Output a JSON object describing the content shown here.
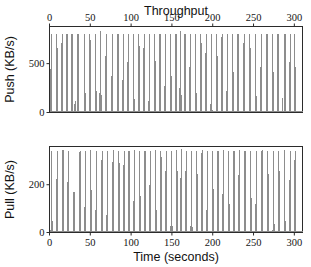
{
  "chart_data": {
    "type": "line",
    "title": "Throughput",
    "xlabel": "Time (seconds)",
    "xlim": [
      0,
      310
    ],
    "xticks": [
      0,
      50,
      100,
      150,
      200,
      250,
      300
    ],
    "xticklabels": [
      "0",
      "50",
      "100",
      "150",
      "200",
      "250",
      "300"
    ],
    "grid": false,
    "legend": null,
    "shared_x_axis": true,
    "line_color": "#8d8d8d",
    "frame_color": "#2b2b2b",
    "background": "#ffffff",
    "panels": [
      {
        "id": "push",
        "ylabel": "Push (KB/s)",
        "ylim": [
          0,
          880
        ],
        "yticks": [
          0,
          500
        ],
        "yticklabels": [
          "0",
          "500"
        ],
        "xtick_labels_position": "top",
        "description": "Dense train of narrow throughput bursts from a ~0 baseline up to roughly 800 KB/s.",
        "baseline": 8,
        "spike_peak_typical": 800,
        "spikes": [
          {
            "t": 2.2,
            "peak": 805,
            "width": 1.1
          },
          {
            "t": 9.0,
            "peak": 800,
            "width": 1.1
          },
          {
            "t": 15.5,
            "peak": 808,
            "width": 1.1
          },
          {
            "t": 21.5,
            "peak": 802,
            "width": 1.1
          },
          {
            "t": 27.5,
            "peak": 800,
            "width": 1.1
          },
          {
            "t": 31.5,
            "peak": 120,
            "width": 0.9
          },
          {
            "t": 35.0,
            "peak": 806,
            "width": 1.1
          },
          {
            "t": 43.0,
            "peak": 800,
            "width": 1.1
          },
          {
            "t": 49.5,
            "peak": 804,
            "width": 1.1
          },
          {
            "t": 56.5,
            "peak": 800,
            "width": 1.1
          },
          {
            "t": 62.5,
            "peak": 830,
            "width": 1.3
          },
          {
            "t": 69.5,
            "peak": 800,
            "width": 1.1
          },
          {
            "t": 77.0,
            "peak": 803,
            "width": 1.1
          },
          {
            "t": 84.0,
            "peak": 800,
            "width": 1.1
          },
          {
            "t": 90.5,
            "peak": 806,
            "width": 1.1
          },
          {
            "t": 96.5,
            "peak": 800,
            "width": 1.1
          },
          {
            "t": 103.0,
            "peak": 802,
            "width": 1.1
          },
          {
            "t": 109.5,
            "peak": 800,
            "width": 1.1
          },
          {
            "t": 116.0,
            "peak": 805,
            "width": 1.1
          },
          {
            "t": 122.5,
            "peak": 800,
            "width": 1.1
          },
          {
            "t": 129.0,
            "peak": 803,
            "width": 1.1
          },
          {
            "t": 135.5,
            "peak": 800,
            "width": 1.1
          },
          {
            "t": 142.0,
            "peak": 806,
            "width": 1.1
          },
          {
            "t": 148.5,
            "peak": 800,
            "width": 1.1
          },
          {
            "t": 155.0,
            "peak": 802,
            "width": 1.1
          },
          {
            "t": 160.5,
            "peak": 838,
            "width": 1.4
          },
          {
            "t": 166.0,
            "peak": 800,
            "width": 1.1
          },
          {
            "t": 172.5,
            "peak": 804,
            "width": 1.1
          },
          {
            "t": 179.0,
            "peak": 800,
            "width": 1.1
          },
          {
            "t": 185.5,
            "peak": 806,
            "width": 1.1
          },
          {
            "t": 192.0,
            "peak": 800,
            "width": 1.1
          },
          {
            "t": 198.5,
            "peak": 802,
            "width": 1.1
          },
          {
            "t": 205.0,
            "peak": 800,
            "width": 1.1
          },
          {
            "t": 211.5,
            "peak": 805,
            "width": 1.1
          },
          {
            "t": 218.0,
            "peak": 800,
            "width": 1.1
          },
          {
            "t": 224.5,
            "peak": 803,
            "width": 1.1
          },
          {
            "t": 231.0,
            "peak": 800,
            "width": 1.1
          },
          {
            "t": 238.5,
            "peak": 806,
            "width": 1.1
          },
          {
            "t": 245.5,
            "peak": 800,
            "width": 1.1
          },
          {
            "t": 252.5,
            "peak": 802,
            "width": 1.1
          },
          {
            "t": 259.5,
            "peak": 800,
            "width": 1.1
          },
          {
            "t": 266.5,
            "peak": 804,
            "width": 1.1
          },
          {
            "t": 273.5,
            "peak": 800,
            "width": 1.1
          },
          {
            "t": 280.0,
            "peak": 806,
            "width": 1.1
          },
          {
            "t": 285.5,
            "peak": 150,
            "width": 1.0
          },
          {
            "t": 288.5,
            "peak": 800,
            "width": 1.1
          },
          {
            "t": 295.0,
            "peak": 802,
            "width": 1.1
          },
          {
            "t": 300.5,
            "peak": 808,
            "width": 1.1
          }
        ]
      },
      {
        "id": "pull",
        "ylabel": "Pull (KB/s)",
        "ylim": [
          0,
          360
        ],
        "yticks": [
          0,
          200
        ],
        "yticklabels": [
          "0",
          "200"
        ],
        "xtick_labels_position": "bottom",
        "description": "Dense train of narrow throughput bursts from a ~0 baseline up to roughly 340 KB/s.",
        "baseline": 4,
        "spike_peak_typical": 340,
        "spikes": [
          {
            "t": 2.5,
            "peak": 342,
            "width": 1.1
          },
          {
            "t": 9.5,
            "peak": 340,
            "width": 1.1
          },
          {
            "t": 16.5,
            "peak": 345,
            "width": 1.3
          },
          {
            "t": 23.0,
            "peak": 340,
            "width": 1.1
          },
          {
            "t": 30.0,
            "peak": 168,
            "width": 1.3
          },
          {
            "t": 37.5,
            "peak": 342,
            "width": 1.1
          },
          {
            "t": 44.0,
            "peak": 340,
            "width": 1.1
          },
          {
            "t": 50.5,
            "peak": 344,
            "width": 1.1
          },
          {
            "t": 57.5,
            "peak": 340,
            "width": 1.1
          },
          {
            "t": 64.5,
            "peak": 342,
            "width": 1.1
          },
          {
            "t": 71.0,
            "peak": 340,
            "width": 1.1
          },
          {
            "t": 78.0,
            "peak": 345,
            "width": 1.1
          },
          {
            "t": 85.0,
            "peak": 340,
            "width": 1.1
          },
          {
            "t": 91.5,
            "peak": 342,
            "width": 1.1
          },
          {
            "t": 97.5,
            "peak": 340,
            "width": 1.1
          },
          {
            "t": 104.0,
            "peak": 344,
            "width": 1.1
          },
          {
            "t": 110.5,
            "peak": 340,
            "width": 1.1
          },
          {
            "t": 117.0,
            "peak": 342,
            "width": 1.1
          },
          {
            "t": 123.5,
            "peak": 340,
            "width": 1.1
          },
          {
            "t": 130.0,
            "peak": 345,
            "width": 1.1
          },
          {
            "t": 136.5,
            "peak": 340,
            "width": 1.1
          },
          {
            "t": 143.0,
            "peak": 342,
            "width": 1.1
          },
          {
            "t": 149.5,
            "peak": 340,
            "width": 1.1
          },
          {
            "t": 156.0,
            "peak": 344,
            "width": 1.1
          },
          {
            "t": 161.5,
            "peak": 348,
            "width": 1.4
          },
          {
            "t": 167.5,
            "peak": 340,
            "width": 1.1
          },
          {
            "t": 174.0,
            "peak": 342,
            "width": 1.1
          },
          {
            "t": 180.5,
            "peak": 340,
            "width": 1.1
          },
          {
            "t": 187.0,
            "peak": 345,
            "width": 1.1
          },
          {
            "t": 193.5,
            "peak": 340,
            "width": 1.1
          },
          {
            "t": 200.0,
            "peak": 342,
            "width": 1.1
          },
          {
            "t": 206.5,
            "peak": 340,
            "width": 1.1
          },
          {
            "t": 213.0,
            "peak": 344,
            "width": 1.1
          },
          {
            "t": 219.5,
            "peak": 340,
            "width": 1.1
          },
          {
            "t": 226.0,
            "peak": 342,
            "width": 1.1
          },
          {
            "t": 232.5,
            "peak": 346,
            "width": 1.3
          },
          {
            "t": 239.5,
            "peak": 340,
            "width": 1.1
          },
          {
            "t": 246.5,
            "peak": 342,
            "width": 1.1
          },
          {
            "t": 253.5,
            "peak": 340,
            "width": 1.1
          },
          {
            "t": 260.5,
            "peak": 344,
            "width": 1.1
          },
          {
            "t": 267.5,
            "peak": 340,
            "width": 1.1
          },
          {
            "t": 274.5,
            "peak": 342,
            "width": 1.1
          },
          {
            "t": 281.0,
            "peak": 340,
            "width": 1.1
          },
          {
            "t": 288.0,
            "peak": 345,
            "width": 1.1
          },
          {
            "t": 295.0,
            "peak": 340,
            "width": 1.1
          },
          {
            "t": 301.0,
            "peak": 343,
            "width": 1.1
          }
        ]
      }
    ]
  }
}
